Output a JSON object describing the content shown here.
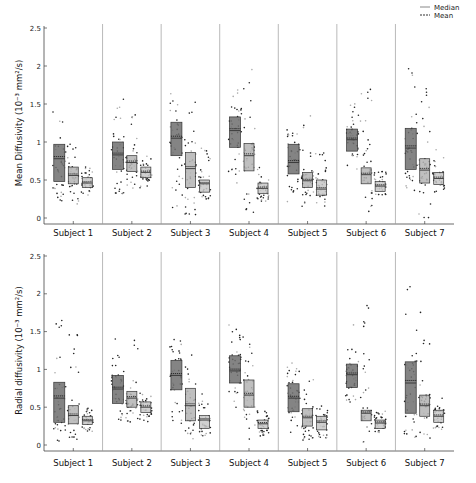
{
  "chart_data": [
    {
      "type": "box",
      "panel": "top",
      "ylabel": "Mean Diffusivity (10⁻³ mm²/s)",
      "ylim": [
        0,
        2.5
      ],
      "yticks": [
        "0",
        "0.5",
        "1",
        "1.5",
        "2",
        "2.5"
      ],
      "categories": [
        "Subject 1",
        "Subject 2",
        "Subject 3",
        "Subject 4",
        "Subject 5",
        "Subject 6",
        "Subject 7"
      ],
      "series": [
        {
          "name": "group-1",
          "color": "#6e6e6e",
          "q1": [
            0.48,
            0.64,
            0.82,
            0.93,
            0.58,
            0.88,
            0.64
          ],
          "median": [
            0.78,
            0.83,
            1.05,
            1.15,
            0.73,
            1.03,
            0.92
          ],
          "q3": [
            0.97,
            1.0,
            1.26,
            1.33,
            0.97,
            1.17,
            1.18
          ],
          "min": [
            0.2,
            0.32,
            0.1,
            0.45,
            0.2,
            0.6,
            0.35
          ],
          "max": [
            1.82,
            1.59,
            1.98,
            1.75,
            1.17,
            1.65,
            2.2
          ]
        },
        {
          "name": "group-2",
          "color": "#b4b4b4",
          "q1": [
            0.45,
            0.61,
            0.4,
            0.62,
            0.4,
            0.45,
            0.46
          ],
          "median": [
            0.56,
            0.73,
            0.65,
            0.82,
            0.49,
            0.57,
            0.63
          ],
          "q3": [
            0.67,
            0.82,
            0.86,
            0.98,
            0.6,
            0.66,
            0.78
          ],
          "min": [
            0.12,
            0.38,
            0.02,
            0.05,
            0.15,
            0.05,
            0.0
          ],
          "max": [
            1.08,
            1.6,
            1.58,
            2.0,
            1.35,
            1.8,
            1.83
          ]
        },
        {
          "name": "group-3",
          "color": "#c8c8c8",
          "q1": [
            0.4,
            0.53,
            0.34,
            0.32,
            0.3,
            0.35,
            0.44
          ],
          "median": [
            0.46,
            0.6,
            0.45,
            0.39,
            0.38,
            0.42,
            0.52
          ],
          "q3": [
            0.53,
            0.67,
            0.5,
            0.46,
            0.5,
            0.48,
            0.6
          ],
          "min": [
            0.3,
            0.38,
            0.25,
            0.22,
            0.15,
            0.3,
            0.34
          ],
          "max": [
            0.7,
            0.82,
            0.93,
            0.68,
            0.88,
            0.62,
            0.95
          ]
        }
      ]
    },
    {
      "type": "box",
      "panel": "bottom",
      "ylabel": "Radial diffusivity (10⁻³ mm²/s)",
      "ylim": [
        0,
        2.5
      ],
      "yticks": [
        "0",
        "0.5",
        "1",
        "1.5",
        "2",
        "2.5"
      ],
      "categories": [
        "Subject 1",
        "Subject 2",
        "Subject 3",
        "Subject 4",
        "Subject 5",
        "Subject 6",
        "Subject 7"
      ],
      "series": [
        {
          "name": "group-1",
          "color": "#6e6e6e",
          "q1": [
            0.3,
            0.55,
            0.73,
            0.82,
            0.44,
            0.76,
            0.42
          ],
          "median": [
            0.62,
            0.74,
            0.92,
            0.98,
            0.62,
            0.93,
            0.82
          ],
          "q3": [
            0.83,
            0.92,
            1.12,
            1.18,
            0.81,
            1.07,
            1.1
          ],
          "min": [
            0.04,
            0.28,
            0.1,
            0.4,
            0.1,
            0.55,
            0.1
          ],
          "max": [
            1.78,
            1.45,
            1.4,
            1.65,
            1.25,
            1.6,
            2.15
          ]
        },
        {
          "name": "group-2",
          "color": "#b4b4b4",
          "q1": [
            0.28,
            0.5,
            0.32,
            0.5,
            0.25,
            0.32,
            0.38
          ],
          "median": [
            0.39,
            0.62,
            0.52,
            0.66,
            0.36,
            0.42,
            0.52
          ],
          "q3": [
            0.52,
            0.71,
            0.75,
            0.86,
            0.48,
            0.46,
            0.66
          ],
          "min": [
            0.07,
            0.27,
            0.08,
            0.05,
            0.05,
            0.02,
            0.03
          ],
          "max": [
            1.78,
            1.48,
            1.38,
            1.9,
            0.98,
            1.87,
            1.82
          ]
        },
        {
          "name": "group-3",
          "color": "#c8c8c8",
          "q1": [
            0.27,
            0.43,
            0.22,
            0.22,
            0.2,
            0.22,
            0.3
          ],
          "median": [
            0.32,
            0.5,
            0.33,
            0.28,
            0.3,
            0.29,
            0.38
          ],
          "q3": [
            0.38,
            0.57,
            0.39,
            0.33,
            0.38,
            0.33,
            0.46
          ],
          "min": [
            0.18,
            0.3,
            0.1,
            0.12,
            0.08,
            0.15,
            0.2
          ],
          "max": [
            0.53,
            0.7,
            0.7,
            0.48,
            0.52,
            0.45,
            0.62
          ]
        }
      ]
    }
  ],
  "legend": {
    "median_label": "Median",
    "mean_label": "Mean"
  }
}
